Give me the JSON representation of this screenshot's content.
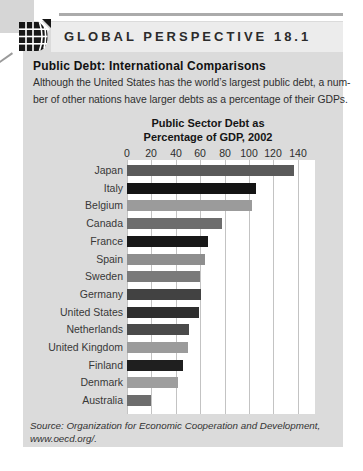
{
  "figure": {
    "kicker": "GLOBAL PERSPECTIVE 18.1",
    "heading": "Public Debt: International Comparisons",
    "intro_lines": [
      "Although the United States has the world’s largest public debt, a num-",
      "ber of other nations have larger debts as a percentage of their GDPs."
    ],
    "source_lines": [
      "Source: Organization for Economic Cooperation and Development,",
      "www.oecd.org/."
    ]
  },
  "icons": {
    "globe": "globe-grid-icon"
  },
  "colors": {
    "panel_bg": "#dbdbdb",
    "band_bg": "#ececec",
    "plot_bg": "#ffffff",
    "gridline": "#c3c3c3",
    "text": "#2d2d2d"
  },
  "chart_data": {
    "type": "bar",
    "orientation": "horizontal",
    "title_lines": [
      "Public Sector Debt as",
      "Percentage of GDP, 2002"
    ],
    "title": "Public Sector Debt as Percentage of GDP, 2002",
    "xlabel": "Percent of GDP",
    "ylabel": "Country",
    "axis_ticks": [
      0,
      20,
      40,
      60,
      80,
      100,
      120,
      140
    ],
    "xlim": [
      0,
      154
    ],
    "grid": true,
    "legend": false,
    "categories": [
      "Japan",
      "Italy",
      "Belgium",
      "Canada",
      "France",
      "Spain",
      "Sweden",
      "Germany",
      "United States",
      "Netherlands",
      "United Kingdom",
      "Finland",
      "Denmark",
      "Australia"
    ],
    "values": [
      137,
      106,
      102,
      78,
      66,
      64,
      60,
      61,
      59,
      51,
      50,
      46,
      42,
      20
    ],
    "bar_colors": [
      "#5a5a5a",
      "#141414",
      "#9b9b9b",
      "#6d6d6d",
      "#181818",
      "#8e8e8e",
      "#7a7a7a",
      "#424242",
      "#2e2e2e",
      "#4a4a4a",
      "#9b9b9b",
      "#1f1f1f",
      "#9e9e9e",
      "#6d6d6d"
    ]
  }
}
